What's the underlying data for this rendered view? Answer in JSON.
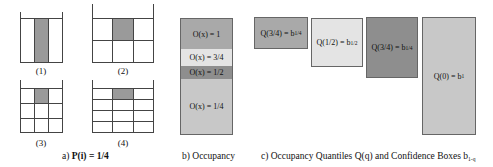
{
  "panel_a": {
    "caption_prefix": "a) ",
    "caption_formula": "P(i) = 1/4",
    "grids": [
      {
        "label": "(1)",
        "rows": 1,
        "cols": 3,
        "highlight": [
          0,
          1
        ]
      },
      {
        "label": "(2)",
        "rows": 2,
        "cols": 3,
        "highlight": [
          0,
          1
        ]
      },
      {
        "label": "(3)",
        "rows": 3,
        "cols": 3,
        "highlight": [
          0,
          1
        ]
      },
      {
        "label": "(4)",
        "rows": 4,
        "cols": 3,
        "highlight": [
          0,
          1
        ]
      }
    ],
    "highlight_color": "#9a9a9a"
  },
  "panel_b": {
    "caption": "b) Occupancy",
    "segments": [
      {
        "label": "O(x) = 1",
        "color": "#a9a9a9"
      },
      {
        "label": "O(x) = 3/4",
        "color": "#e4e4e4"
      },
      {
        "label": "O(x) = 1/2",
        "color": "#8e8e8e"
      },
      {
        "label": "O(x) = 1/4",
        "color": "#c8c8c8"
      }
    ]
  },
  "panel_c": {
    "caption_text": "c) Occupancy Quantiles Q(q) and Confidence Boxes b",
    "caption_sub": "1-q",
    "boxes": [
      {
        "label": "Q(3/4) = b",
        "sub": "1/4",
        "color": "#a9a9a9"
      },
      {
        "label": "Q(1/2) = b",
        "sub": "1/2",
        "color": "#e4e4e4"
      },
      {
        "label": "Q(3/4) = b",
        "sub": "1/4",
        "color": "#8e8e8e"
      },
      {
        "label": "Q(0) = b",
        "sub": "1",
        "color": "#c8c8c8"
      }
    ]
  }
}
